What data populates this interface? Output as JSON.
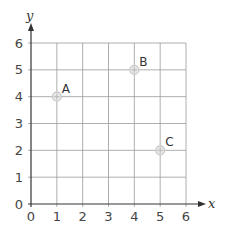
{
  "chart_data": {
    "type": "scatter",
    "title": "",
    "xlabel": "x",
    "ylabel": "y",
    "xlim": [
      0,
      6
    ],
    "ylim": [
      0,
      6
    ],
    "grid": true,
    "x_ticks": [
      "0",
      "1",
      "2",
      "3",
      "4",
      "5",
      "6"
    ],
    "y_ticks": [
      "0",
      "1",
      "2",
      "3",
      "4",
      "5",
      "6"
    ],
    "points": [
      {
        "label": "A",
        "x": 1,
        "y": 4
      },
      {
        "label": "B",
        "x": 4,
        "y": 5
      },
      {
        "label": "C",
        "x": 5,
        "y": 2
      }
    ],
    "legend": null
  },
  "colors": {
    "grid": "#9a9a9a",
    "axis": "#333333",
    "marker": "#c8c8c8"
  }
}
